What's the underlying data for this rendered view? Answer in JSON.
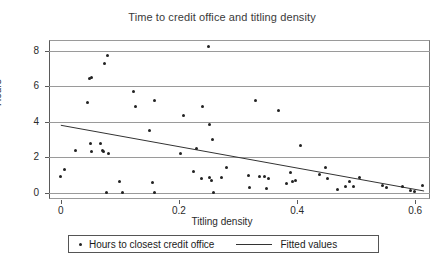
{
  "chart_data": {
    "type": "scatter",
    "title": "Time to credit office and titling density",
    "xlabel": "Titling density",
    "ylabel": "Hours",
    "xlim": [
      -0.02,
      0.625
    ],
    "ylim": [
      -0.35,
      8.6
    ],
    "xticks": [
      0,
      0.2,
      0.4,
      0.6
    ],
    "xtick_labels": [
      "0",
      "0.2",
      "0.4",
      "0.6"
    ],
    "yticks": [
      0,
      2,
      4,
      6,
      8
    ],
    "ytick_labels": [
      "0",
      "2",
      "4",
      "6",
      "8"
    ],
    "grid": "horizontal",
    "legend_position": "below-axes",
    "series": [
      {
        "name": "Hours to closest credit office",
        "marker": "dot",
        "color": "#222222",
        "points": [
          [
            0.0,
            0.9
          ],
          [
            0.007,
            1.33
          ],
          [
            0.025,
            2.38
          ],
          [
            0.046,
            5.1
          ],
          [
            0.048,
            6.44
          ],
          [
            0.052,
            6.47
          ],
          [
            0.05,
            2.8
          ],
          [
            0.052,
            2.3
          ],
          [
            0.067,
            2.78
          ],
          [
            0.07,
            2.4
          ],
          [
            0.072,
            2.32
          ],
          [
            0.074,
            7.26
          ],
          [
            0.079,
            7.75
          ],
          [
            0.08,
            2.22
          ],
          [
            0.078,
            0.0
          ],
          [
            0.1,
            0.62
          ],
          [
            0.105,
            0.0
          ],
          [
            0.123,
            5.68
          ],
          [
            0.127,
            4.85
          ],
          [
            0.15,
            3.53
          ],
          [
            0.155,
            0.6
          ],
          [
            0.158,
            5.18
          ],
          [
            0.158,
            0.0
          ],
          [
            0.203,
            2.22
          ],
          [
            0.208,
            4.37
          ],
          [
            0.225,
            1.22
          ],
          [
            0.23,
            2.48
          ],
          [
            0.238,
            0.78
          ],
          [
            0.24,
            4.83
          ],
          [
            0.25,
            8.25
          ],
          [
            0.252,
            3.82
          ],
          [
            0.252,
            0.88
          ],
          [
            0.255,
            0.7
          ],
          [
            0.256,
            2.98
          ],
          [
            0.258,
            0.0
          ],
          [
            0.272,
            0.85
          ],
          [
            0.28,
            1.4
          ],
          [
            0.318,
            0.98
          ],
          [
            0.32,
            0.3
          ],
          [
            0.33,
            5.2
          ],
          [
            0.336,
            0.92
          ],
          [
            0.345,
            0.9
          ],
          [
            0.348,
            0.23
          ],
          [
            0.352,
            0.83
          ],
          [
            0.368,
            4.63
          ],
          [
            0.382,
            0.52
          ],
          [
            0.388,
            1.12
          ],
          [
            0.392,
            0.63
          ],
          [
            0.398,
            0.68
          ],
          [
            0.405,
            2.65
          ],
          [
            0.438,
            1.05
          ],
          [
            0.448,
            1.44
          ],
          [
            0.452,
            0.82
          ],
          [
            0.468,
            0.17
          ],
          [
            0.482,
            0.33
          ],
          [
            0.488,
            0.62
          ],
          [
            0.495,
            0.35
          ],
          [
            0.505,
            0.88
          ],
          [
            0.545,
            0.42
          ],
          [
            0.552,
            0.32
          ],
          [
            0.578,
            0.38
          ],
          [
            0.592,
            0.12
          ],
          [
            0.598,
            0.08
          ],
          [
            0.612,
            0.4
          ]
        ]
      }
    ],
    "fit": {
      "name": "Fitted values",
      "color": "#333333",
      "x": [
        0.0,
        0.615
      ],
      "y": [
        3.8,
        0.1
      ]
    }
  },
  "legend": {
    "points_label": "Hours to closest credit office",
    "line_label": "Fitted values"
  }
}
